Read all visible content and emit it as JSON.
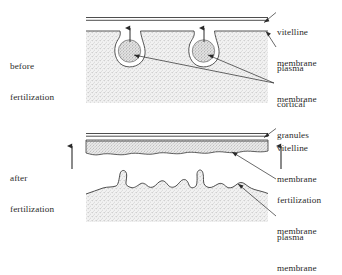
{
  "figure": {
    "background_color": "#ffffff",
    "ink_color": "#2a2a2a",
    "cytoplasm_fill": "#efefef",
    "granule_fill": "#c9c9c9",
    "panels": [
      {
        "id": "before",
        "stage_label_line1": "before",
        "stage_label_line2": "fertilization",
        "callouts": [
          {
            "id": "vitelline-membrane",
            "line1": "vitelline",
            "line2": "membrane"
          },
          {
            "id": "plasma-membrane",
            "line1": "plasma",
            "line2": "membrane"
          },
          {
            "id": "cortical-granules",
            "line1": "cortical",
            "line2": "granules"
          }
        ],
        "granule_count": 2,
        "arrow_direction": "up"
      },
      {
        "id": "after",
        "stage_label_line1": "after",
        "stage_label_line2": "fertilization",
        "callouts": [
          {
            "id": "vitelline-membrane",
            "line1": "vitelline",
            "line2": "membrane"
          },
          {
            "id": "fertilization-membrane",
            "line1": "fertilization",
            "line2": "membrane"
          },
          {
            "id": "plasma-membrane",
            "line1": "plasma",
            "line2": "membrane"
          }
        ],
        "arrow_direction": "up",
        "arrow_count": 2
      }
    ]
  }
}
